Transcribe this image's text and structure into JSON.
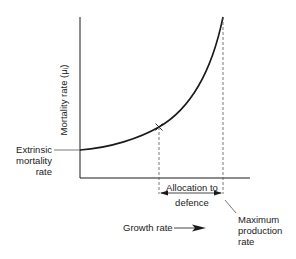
{
  "diagram": {
    "y_axis_label": "Mortality rate (μᵢ)",
    "x_axis_label": "Growth rate",
    "extrinsic_label": [
      "Extrinsic",
      "mortality",
      "rate"
    ],
    "allocation_label": [
      "Allocation to",
      "defence"
    ],
    "max_production_label": [
      "Maximum",
      "production",
      "rate"
    ],
    "colors": {
      "line": "#1a1a1a",
      "guide": "#555555"
    }
  }
}
